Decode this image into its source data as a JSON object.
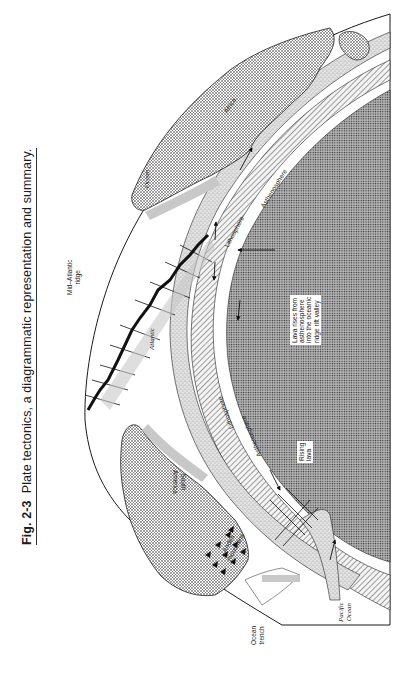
{
  "figure": {
    "number": "Fig. 2-3",
    "caption": "Plate tectonics, a diagrammatic representation and summary.",
    "orientation": "rotated 90° counter-clockwise"
  },
  "labels": {
    "mid_atlantic_ridge_line1": "Mid–Atlantic",
    "mid_atlantic_ridge_line2": "ridge",
    "atlantic": "Atlantic",
    "ocean": "Ocean",
    "africa": "Africa",
    "south_america_line1": "South",
    "south_america_line2": "America",
    "andes_line1": "Andes",
    "andes_line2": "mountains",
    "lithosphere_left": "Lithosphere",
    "asthenosphere_left": "Asthenosphere",
    "lithosphere_right": "Lithosphere",
    "asthenosphere_right": "Asthenosphere",
    "lava_callout_line1": "Lava rises from",
    "lava_callout_line2": "asthenosphere",
    "lava_callout_line3": "into the oceanic",
    "lava_callout_line4": "ridge rift valley",
    "rising_lava_line1": "Rising",
    "rising_lava_line2": "lava",
    "ocean_trench_line1": "Ocean",
    "ocean_trench_line2": "trench",
    "pacific_line1": "Pacific",
    "pacific_line2": "Ocean"
  },
  "colors": {
    "ink": "#1a1a1a",
    "core_fill": "#9a9a9a",
    "lithosphere_fill": "#d4d4d4",
    "continent_fill": "#c8c8c8",
    "paper": "#ffffff"
  }
}
